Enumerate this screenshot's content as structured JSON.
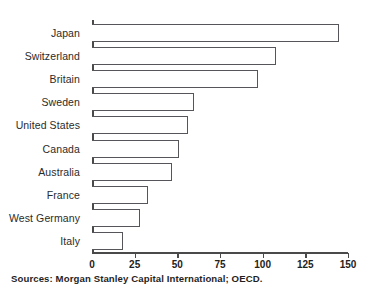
{
  "chart_data": {
    "type": "bar",
    "orientation": "horizontal",
    "title": "",
    "subtitle": "",
    "xlabel": "",
    "ylabel": "",
    "categories": [
      "Japan",
      "Switzerland",
      "Britain",
      "Sweden",
      "United States",
      "Canada",
      "Australia",
      "France",
      "West Germany",
      "Italy"
    ],
    "values": [
      145,
      108,
      97,
      60,
      56,
      51,
      47,
      33,
      28,
      18
    ],
    "xlim": [
      0,
      150
    ],
    "tick_values": [
      0,
      25,
      50,
      75,
      100,
      125,
      150
    ],
    "tick_labels": [
      "0",
      "25",
      "50",
      "75",
      "100",
      "125",
      "150"
    ],
    "grid": false,
    "legend": null,
    "bar_fill_color": "#ffffff",
    "bar_edge_color": "#55555a",
    "axis_color": "#4a4a4a"
  },
  "source_note": "Sources: Morgan Stanley Capital International; OECD."
}
